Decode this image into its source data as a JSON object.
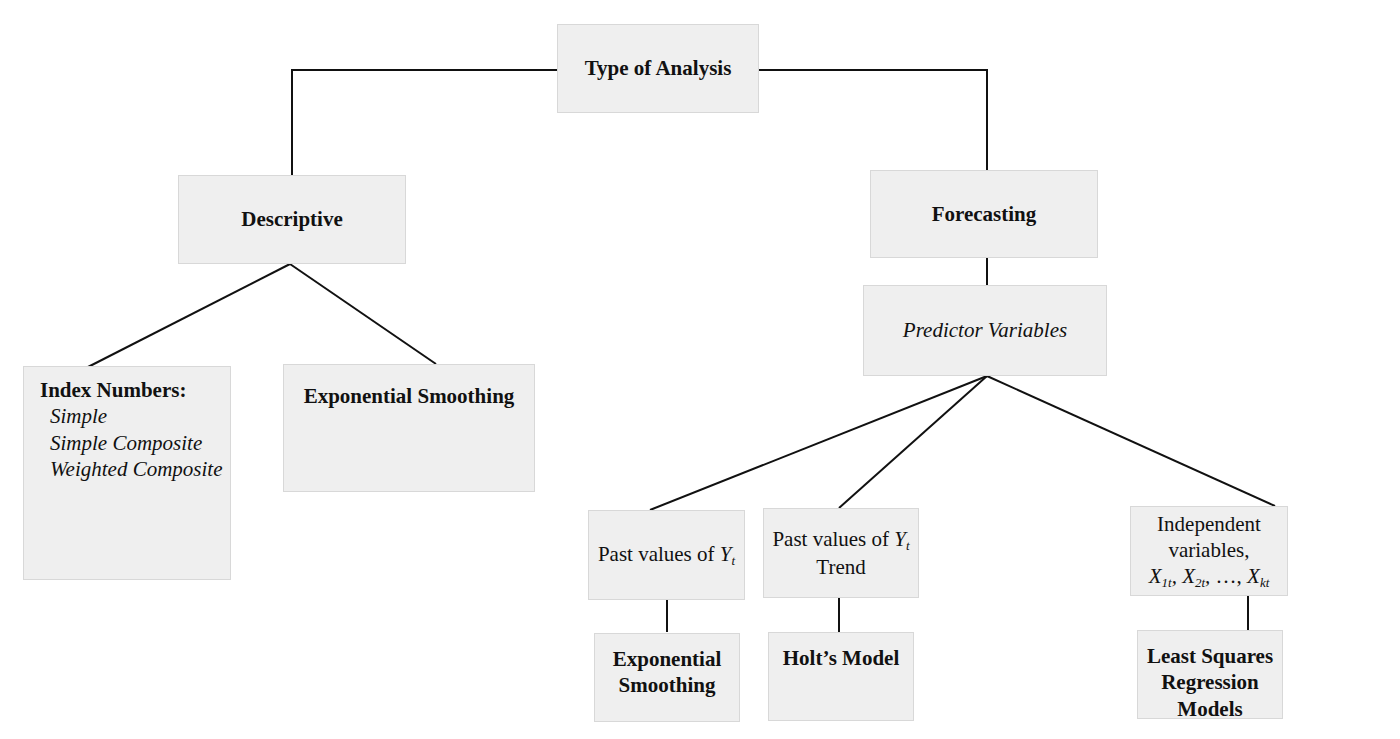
{
  "diagram": {
    "root": {
      "label": "Type of Analysis"
    },
    "descriptive": {
      "label": "Descriptive",
      "children": {
        "index_numbers": {
          "label": "Index Numbers:",
          "items": [
            "Simple",
            "Simple Composite",
            "Weighted Composite"
          ]
        },
        "exp_smoothing": {
          "label": "Exponential Smoothing"
        }
      }
    },
    "forecasting": {
      "label": "Forecasting",
      "predictor": {
        "label": "Predictor Variables"
      },
      "branches": [
        {
          "predictor_text": "Past values of ",
          "var": "Y",
          "var_sub": "t",
          "extra": "",
          "model": [
            "Exponential",
            "Smoothing"
          ]
        },
        {
          "predictor_text": "Past values of ",
          "var": "Y",
          "var_sub": "t",
          "extra": "Trend",
          "model": [
            "Holt’s Model"
          ]
        },
        {
          "predictor_text": "Independent variables,",
          "vars": "X1t, X2t, …, Xkt",
          "var_parts": [
            {
              "v": "X",
              "s": "1t"
            },
            {
              "v": "X",
              "s": "2t"
            },
            {
              "v": "X",
              "s": "kt"
            }
          ],
          "ellipsis": "…,",
          "model": [
            "Least Squares",
            "Regression Models"
          ]
        }
      ]
    }
  }
}
